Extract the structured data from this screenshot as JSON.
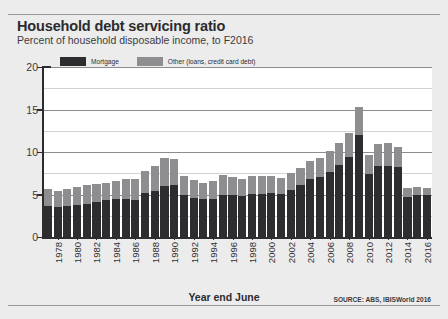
{
  "figure": {
    "title": "Household debt servicing ratio",
    "subtitle": "Percent of household disposable income, to F2016",
    "source": "SOURCE: ABS, IBISWorld 2016",
    "background_color": "#ececed",
    "plot_background_color": "#ffffff"
  },
  "chart_data": {
    "type": "bar",
    "stacked": true,
    "title": "Household debt servicing ratio",
    "subtitle": "Percent of household disposable income, to F2016",
    "xlabel": "Year end June",
    "ylabel": "",
    "ylim": [
      0,
      20
    ],
    "yticks": [
      0,
      5,
      10,
      15,
      20
    ],
    "ytick_labels": [
      "0",
      "5",
      "10",
      "15",
      "20"
    ],
    "grid": true,
    "legend_position": "top-left",
    "colors": {
      "mortgage": "#2d2d2f",
      "other": "#8e8e91"
    },
    "categories": [
      1977,
      1978,
      1979,
      1980,
      1981,
      1982,
      1983,
      1984,
      1985,
      1986,
      1987,
      1988,
      1989,
      1990,
      1991,
      1992,
      1993,
      1994,
      1995,
      1996,
      1997,
      1998,
      1999,
      2000,
      2001,
      2002,
      2003,
      2004,
      2005,
      2006,
      2007,
      2008,
      2009,
      2010,
      2011,
      2012,
      2013,
      2014,
      2015,
      2016
    ],
    "tick_labels": [
      "",
      "1978",
      "",
      "1980",
      "",
      "1982",
      "",
      "1984",
      "",
      "1986",
      "",
      "1988",
      "",
      "1990",
      "",
      "1992",
      "",
      "1994",
      "",
      "1996",
      "",
      "1998",
      "",
      "2000",
      "",
      "2002",
      "",
      "2004",
      "",
      "2006",
      "",
      "2008",
      "",
      "2010",
      "",
      "2012",
      "",
      "2014",
      "",
      "2016"
    ],
    "series": [
      {
        "name": "Mortgage",
        "color": "#2d2d2f",
        "values": [
          3.6,
          3.5,
          3.7,
          3.8,
          3.9,
          4.1,
          4.3,
          4.5,
          4.5,
          4.4,
          5.2,
          5.4,
          6.0,
          6.1,
          5.0,
          4.6,
          4.5,
          4.5,
          5.0,
          4.9,
          4.8,
          5.1,
          5.1,
          5.2,
          5.1,
          5.5,
          6.1,
          6.8,
          7.1,
          7.7,
          8.5,
          9.4,
          12.0,
          7.4,
          8.3,
          8.4,
          8.2,
          4.7,
          4.9,
          4.9
        ]
      },
      {
        "name": "Other (loans, credit card debt)",
        "color": "#8e8e91",
        "values": [
          2.1,
          1.9,
          2.0,
          2.1,
          2.2,
          2.1,
          2.0,
          2.1,
          2.3,
          2.4,
          2.6,
          3.0,
          3.3,
          3.1,
          2.2,
          2.1,
          1.9,
          2.1,
          2.3,
          2.2,
          2.0,
          2.1,
          2.1,
          2.0,
          1.9,
          2.0,
          2.0,
          2.1,
          2.2,
          2.4,
          2.6,
          2.8,
          3.3,
          2.3,
          2.7,
          2.7,
          2.4,
          1.1,
          1.0,
          0.9
        ]
      }
    ],
    "totals": [
      5.7,
      5.4,
      5.7,
      5.9,
      6.1,
      6.2,
      6.3,
      6.6,
      6.8,
      6.8,
      7.8,
      8.4,
      9.3,
      9.2,
      7.2,
      6.7,
      6.4,
      6.6,
      7.3,
      7.1,
      6.8,
      7.2,
      7.2,
      7.2,
      7.0,
      7.5,
      8.1,
      8.9,
      9.3,
      10.1,
      11.1,
      12.2,
      15.3,
      9.7,
      11.0,
      11.1,
      10.6,
      5.8,
      5.9,
      5.8
    ]
  },
  "legend": {
    "items": [
      {
        "label": "Mortgage",
        "color": "#2d2d2f"
      },
      {
        "label": "Other (loans, credit card debt)",
        "color": "#8e8e91"
      }
    ]
  },
  "axes": {
    "x_title": "Year end June"
  }
}
